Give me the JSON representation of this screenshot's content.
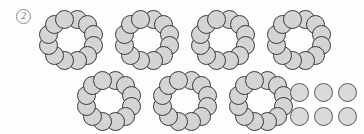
{
  "worksheet": {
    "problem_number": "2",
    "background_color": "#fdfdfd"
  },
  "counters": {
    "fill_color": "#d4d4d4",
    "stroke_color": "#3a3a3a",
    "diameter_px": 19,
    "counters_per_ring": 12,
    "ring_count": 7,
    "loose_count": 6,
    "total_count": 90
  },
  "groups": [
    {
      "name": "ring-1",
      "kind": "ring",
      "count": 12,
      "row": 1,
      "col": 1,
      "x": 38,
      "y": 9
    },
    {
      "name": "ring-2",
      "kind": "ring",
      "count": 12,
      "row": 1,
      "col": 2,
      "x": 114,
      "y": 9
    },
    {
      "name": "ring-3",
      "kind": "ring",
      "count": 12,
      "row": 1,
      "col": 3,
      "x": 190,
      "y": 9
    },
    {
      "name": "ring-4",
      "kind": "ring",
      "count": 12,
      "row": 1,
      "col": 4,
      "x": 266,
      "y": 9
    },
    {
      "name": "ring-5",
      "kind": "ring",
      "count": 12,
      "row": 2,
      "col": 1,
      "x": 76,
      "y": 70
    },
    {
      "name": "ring-6",
      "kind": "ring",
      "count": 12,
      "row": 2,
      "col": 2,
      "x": 152,
      "y": 70
    },
    {
      "name": "ring-7",
      "kind": "ring",
      "count": 12,
      "row": 2,
      "col": 3,
      "x": 228,
      "y": 70
    },
    {
      "name": "loose-cluster",
      "kind": "cluster",
      "count": 6,
      "rows": 2,
      "cols": 3,
      "row": 2,
      "col": 4,
      "x": 290,
      "y": 83
    }
  ]
}
